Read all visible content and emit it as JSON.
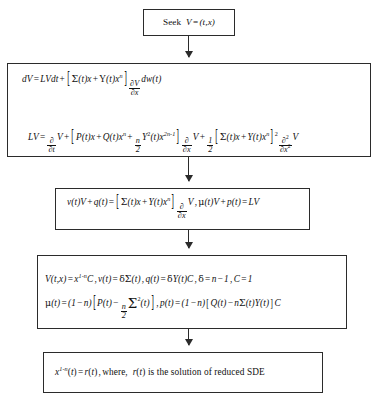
{
  "diagram": {
    "type": "flowchart",
    "orientation": "top-to-bottom",
    "node_count": 5,
    "arrow_count": 4,
    "colors": {
      "border": "#2b2b2b",
      "background": "#ffffff",
      "text": "#111111"
    },
    "nodes": [
      {
        "id": "seek",
        "name": "seek-box",
        "shape": "rectangle",
        "lines": [
          "Seek V = (t, x)"
        ],
        "plain_text": "Seek V = (t, x)"
      },
      {
        "id": "dv",
        "name": "dv-lv-box",
        "shape": "rectangle",
        "lines": [
          "dV = LVdt + [ Σ(t)x + Y(t)x^n ] ∂V/∂x dw(t)",
          "LV = ∂/∂t V + [ P(t)x + Q(t)x^n + (n/2) Y^2(t) x^(2n-1) ] ∂/∂x V + (1/2) [ Σ(t)x + Y(t)x^n ]^2 ∂^2/∂x^2 V"
        ],
        "plain_text": "dV = LVdt + [Σ(t)x + Y(t)x^n] ∂V/∂x dw(t); LV = ∂/∂t V + [P(t)x + Q(t)x^n + n/2 Y²(t)x^{2n-1}] ∂/∂x V + 1/2 [Σ(t)x + Y(t)x^n]² ∂²/∂x² V"
      },
      {
        "id": "vq",
        "name": "vq-condition-box",
        "shape": "rectangle",
        "lines": [
          "v(t)V + q(t) = [ Σ(t)x + Y(t)x^n ] ∂/∂x V , μ(t)V + p(t) = LV"
        ],
        "plain_text": "v(t)V + q(t) = [Σ(t)x + Y(t)x^n] ∂/∂x V, μ(t)V + p(t) = LV"
      },
      {
        "id": "vtx",
        "name": "vtx-coefficients-box",
        "shape": "rectangle",
        "lines": [
          "V(t,x) = x^(1-n) C, v(t) = δΣ(t), q(t) = δY(t)C, δ = n − 1, C = 1",
          "μ(t) = (1 − n)[ P(t) − (n/2) Σ²(t) ], p(t) = (1 − n)[ Q(t) − nΣ(t)Y(t) ]C"
        ],
        "plain_text": "V(t,x) = x^{1-n}C, v(t) = δΣ(t), q(t) = δY(t)C, δ = n-1, C = 1; μ(t) = (1-n)[P(t) - n/2 Σ²(t)], p(t) = (1-n)[Q(t) - nΣ(t)Y(t)]C"
      },
      {
        "id": "sol",
        "name": "solution-box",
        "shape": "rectangle",
        "lines": [
          "x^(1-n)(t) = r(t), where, r(t) is the solution of reduced SDE"
        ],
        "plain_text": "x^{1-n}(t) = r(t), where, r(t) is the solution of reduced SDE"
      }
    ],
    "arrows": [
      {
        "name": "arrow-seek-to-dv",
        "from": "seek",
        "to": "dv",
        "direction": "down"
      },
      {
        "name": "arrow-dv-to-vq",
        "from": "dv",
        "to": "vq",
        "direction": "down"
      },
      {
        "name": "arrow-vq-to-vtx",
        "from": "vq",
        "to": "vtx",
        "direction": "down"
      },
      {
        "name": "arrow-vtx-to-sol",
        "from": "vtx",
        "to": "sol",
        "direction": "down"
      }
    ]
  },
  "labels": {
    "seek_text": "Seek",
    "where_text": "where,",
    "is_the_solution_text": "is the solution of reduced SDE"
  }
}
